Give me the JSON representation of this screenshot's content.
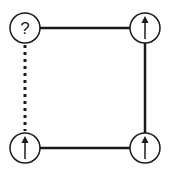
{
  "diagram": {
    "type": "spin-plaquette",
    "colors": {
      "stroke": "#1a1a1a",
      "background": "#ffffff"
    },
    "nodes": [
      {
        "id": "top-left",
        "symbol": "?",
        "kind": "unknown",
        "cx": 25,
        "cy": 28
      },
      {
        "id": "top-right",
        "symbol": "up-arrow",
        "kind": "spin-up",
        "cx": 145,
        "cy": 28
      },
      {
        "id": "bottom-left",
        "symbol": "up-arrow",
        "kind": "spin-up",
        "cx": 25,
        "cy": 148
      },
      {
        "id": "bottom-right",
        "symbol": "up-arrow",
        "kind": "spin-up",
        "cx": 145,
        "cy": 148
      }
    ],
    "edges": [
      {
        "from": "top-left",
        "to": "top-right",
        "style": "solid"
      },
      {
        "from": "top-right",
        "to": "bottom-right",
        "style": "solid"
      },
      {
        "from": "bottom-left",
        "to": "bottom-right",
        "style": "solid"
      },
      {
        "from": "top-left",
        "to": "bottom-left",
        "style": "dashed"
      }
    ],
    "unknown_label": "?"
  }
}
